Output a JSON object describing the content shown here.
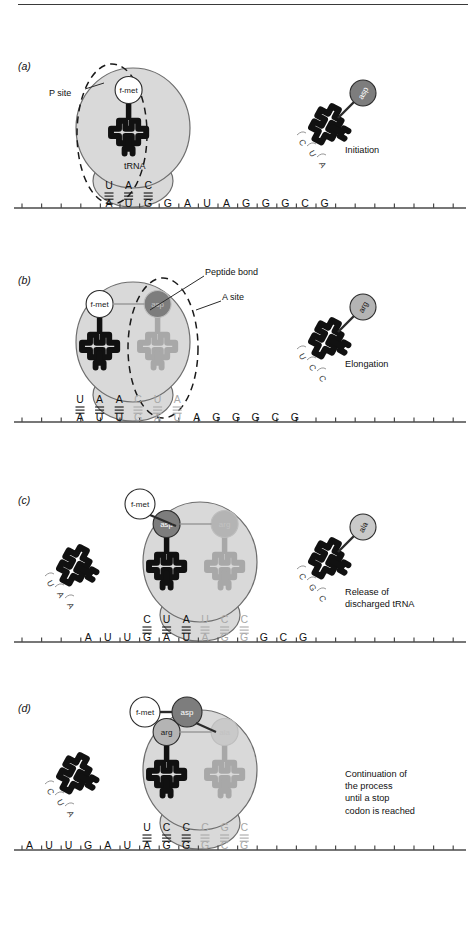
{
  "figure": {
    "colors": {
      "ribosome_fill": "#d9d9d9",
      "ribosome_stroke": "#6e6e6e",
      "trna_stroke": "#111111",
      "mrna_line": "#4a4a4a",
      "aa_fmet": "#ffffff",
      "aa_asp": "#7d7d7d",
      "aa_arg": "#b4b4b4",
      "aa_ala": "#c9c9c9",
      "faded_text": "#a8a8a8",
      "dark_text": "#111111"
    }
  },
  "panels": [
    {
      "letter": "(a)",
      "caption": "Initiation",
      "labels": [
        {
          "name": "p-site-label",
          "text": "P site"
        },
        {
          "name": "trna-label",
          "text": "tRNA"
        }
      ],
      "site_ellipse": "P site",
      "bound_trnas": [
        {
          "amino_acid": "f-met",
          "shade": "fmet",
          "anticodon": [
            "U",
            "A",
            "C"
          ],
          "codon": [
            "A",
            "U",
            "G"
          ],
          "faded": false
        }
      ],
      "mrna_tail_left": [],
      "mrna_tail_right": [
        "G",
        "A",
        "U",
        "A",
        "G",
        "G",
        "G",
        "C",
        "G"
      ],
      "free_trnas": [
        {
          "amino_acid": "asp",
          "shade": "asp",
          "anticodon": [
            "C",
            "U",
            "A"
          ],
          "side": "right",
          "discharged": false
        }
      ]
    },
    {
      "letter": "(b)",
      "caption": "Elongation",
      "labels": [
        {
          "name": "peptide-bond-label",
          "text": "Peptide bond"
        },
        {
          "name": "a-site-label",
          "text": "A site"
        }
      ],
      "site_ellipse": "A site",
      "bound_trnas": [
        {
          "amino_acid": "f-met",
          "shade": "fmet",
          "anticodon": [
            "U",
            "A",
            "A"
          ],
          "codon": [
            "A",
            "U",
            "U"
          ],
          "faded": false
        },
        {
          "amino_acid": "asp",
          "shade": "asp",
          "anticodon": [
            "C",
            "U",
            "A"
          ],
          "codon": [
            "G",
            "A",
            "U"
          ],
          "faded": true
        }
      ],
      "mrna_tail_left": [],
      "mrna_tail_right": [
        "A",
        "G",
        "G",
        "G",
        "C",
        "G"
      ],
      "free_trnas": [
        {
          "amino_acid": "arg",
          "shade": "arg",
          "anticodon": [
            "U",
            "C",
            "C"
          ],
          "side": "right",
          "discharged": false
        }
      ]
    },
    {
      "letter": "(c)",
      "caption": "Release of\ndischarged tRNA",
      "labels": [
        {
          "name": "fmet-label",
          "text": "f-met"
        }
      ],
      "site_ellipse": "",
      "bound_trnas": [
        {
          "amino_acid": "asp",
          "shade": "asp",
          "anticodon": [
            "C",
            "U",
            "A"
          ],
          "codon": [
            "G",
            "A",
            "U"
          ],
          "faded": false
        },
        {
          "amino_acid": "arg",
          "shade": "arg",
          "anticodon": [
            "U",
            "C",
            "C"
          ],
          "codon": [
            "A",
            "G",
            "G"
          ],
          "faded": true
        }
      ],
      "mrna_tail_left": [
        "A",
        "U",
        "U"
      ],
      "mrna_tail_right": [
        "G",
        "C",
        "G"
      ],
      "free_trnas": [
        {
          "amino_acid": "",
          "shade": "none",
          "anticodon": [
            "U",
            "A",
            "A"
          ],
          "side": "left",
          "discharged": true
        },
        {
          "amino_acid": "ala",
          "shade": "ala",
          "anticodon": [
            "C",
            "G",
            "C"
          ],
          "side": "right",
          "discharged": false
        }
      ]
    },
    {
      "letter": "(d)",
      "caption": "Continuation of\nthe process\nuntil a stop\ncodon is reached",
      "labels": [
        {
          "name": "fmet-label",
          "text": "f-met"
        },
        {
          "name": "asp-label",
          "text": "asp"
        }
      ],
      "site_ellipse": "",
      "bound_trnas": [
        {
          "amino_acid": "arg",
          "shade": "arg",
          "anticodon": [
            "U",
            "C",
            "C"
          ],
          "codon": [
            "A",
            "G",
            "G"
          ],
          "faded": false
        },
        {
          "amino_acid": "ala",
          "shade": "ala",
          "anticodon": [
            "C",
            "G",
            "C"
          ],
          "codon": [
            "G",
            "C",
            "G"
          ],
          "faded": true
        }
      ],
      "mrna_tail_left": [
        "A",
        "U",
        "U",
        "G",
        "A",
        "U"
      ],
      "mrna_tail_right": [],
      "free_trnas": [
        {
          "amino_acid": "",
          "shade": "none",
          "anticodon": [
            "C",
            "U",
            "A"
          ],
          "side": "left",
          "discharged": true
        }
      ]
    }
  ]
}
